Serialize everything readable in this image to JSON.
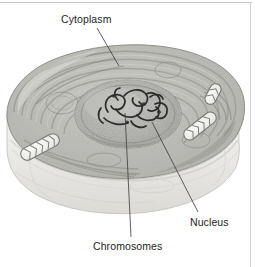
{
  "figure": {
    "domain": "Diagram",
    "style": "grayscale-halftone-illustration",
    "width": 255,
    "height": 267,
    "background_color": "#ffffff",
    "border_color": "#c8c8cc",
    "line_color": "#3a3a3a",
    "text_color": "#1d1d1d"
  },
  "labels": {
    "cytoplasm": "Cytoplasm",
    "nucleus": "Nucleus",
    "chromosomes": "Chromosomes"
  },
  "leaders": {
    "cytoplasm": "line from Cytoplasm text down-right to cell top surface",
    "nucleus": "line from nucleus edge down-right to Nucleus text",
    "chromosomes": "near-vertical line from chromosomes down to Chromosomes text"
  },
  "structures": {
    "cell_membrane": "outer rounded boundary of the cut cell",
    "cut_face": "pale lower depth wall of the sectioned cell",
    "cytoplasm_texture": "concentric swirling endoplasmic-reticulum membranes",
    "nucleus": "central granular oval body",
    "chromosomes": "dark tangled threads inside the nucleus",
    "mitochondria_count": 3,
    "mitochondria": "pale elongated organelles with internal cristae"
  },
  "palette": {
    "cell_top_light": "#d8d8d4",
    "cell_top_mid": "#b9b9b4",
    "cell_top_dark": "#9b9b96",
    "cut_face_light": "#f0efec",
    "cut_face_shadow": "#cfcec9",
    "nucleus_fill": "#b2b2ad",
    "nucleus_granules": "#8d8d88",
    "chromosome_ink": "#2e2e2e",
    "mitochondria_fill": "#f2f1ee",
    "mitochondria_outline": "#6e6e69"
  }
}
